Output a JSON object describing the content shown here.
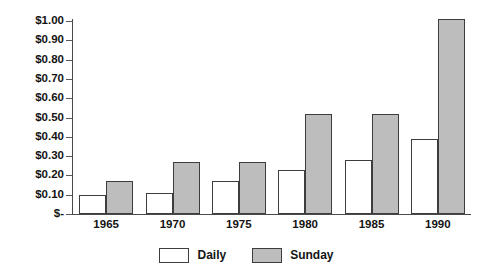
{
  "chart_data": {
    "type": "bar",
    "title": "",
    "subtitle": "",
    "xlabel": "",
    "ylabel": "",
    "categories": [
      "1965",
      "1970",
      "1975",
      "1980",
      "1985",
      "1990"
    ],
    "series": [
      {
        "name": "Daily",
        "color": "#ffffff",
        "values": [
          0.1,
          0.11,
          0.17,
          0.23,
          0.28,
          0.39
        ]
      },
      {
        "name": "Sunday",
        "color": "#bdbdbd",
        "values": [
          0.17,
          0.27,
          0.27,
          0.52,
          0.52,
          1.01
        ]
      }
    ],
    "ylim": [
      0,
      1.0
    ],
    "ytick_values": [
      0,
      0.1,
      0.2,
      0.3,
      0.4,
      0.5,
      0.6,
      0.7,
      0.8,
      0.9,
      1.0
    ],
    "ytick_labels": [
      "$-",
      "$0.10",
      "$0.20",
      "$0.30",
      "$0.40",
      "$0.50",
      "$0.60",
      "$0.70",
      "$0.80",
      "$0.90",
      "$1.00"
    ],
    "grid": false,
    "legend_position": "bottom",
    "annotations": []
  },
  "legend": {
    "items": [
      {
        "label": "Daily",
        "swatch": "white-swatch"
      },
      {
        "label": "Sunday",
        "swatch": "gray-swatch"
      }
    ]
  },
  "colors": {
    "daily_fill": "#ffffff",
    "sunday_fill": "#bdbdbd",
    "bar_outline": "#3d3d3d",
    "axis": "#4a4a4a",
    "text": "#141414",
    "background": "#ffffff"
  }
}
